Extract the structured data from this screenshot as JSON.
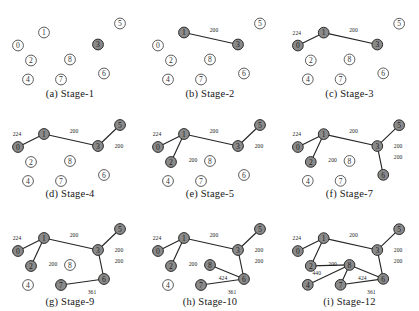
{
  "figure": {
    "title": "",
    "columns": 3,
    "rows": 3,
    "node_ids": [
      "0",
      "1",
      "2",
      "3",
      "4",
      "5",
      "6",
      "7",
      "8"
    ],
    "node_positions": {
      "0": [
        18,
        44
      ],
      "1": [
        44,
        31
      ],
      "2": [
        31,
        59
      ],
      "3": [
        98,
        43
      ],
      "4": [
        28,
        78
      ],
      "5": [
        120,
        22
      ],
      "6": [
        104,
        72
      ],
      "7": [
        61,
        78
      ],
      "8": [
        70,
        58
      ]
    },
    "colors": {
      "node_fill_selected": "#8a8a8a",
      "node_fill_unselected": "#ffffff",
      "node_stroke": "#3a3a3a",
      "edge_stroke": "#262626",
      "text": "#1a1a1a",
      "background": "#ffffff"
    }
  },
  "panels": [
    {
      "id": "panel-a",
      "caption": "(a) Stage-1",
      "selected_nodes": [
        "3"
      ],
      "edges": []
    },
    {
      "id": "panel-b",
      "caption": "(b) Stage-2",
      "selected_nodes": [
        "1",
        "3"
      ],
      "edges": [
        {
          "from": "1",
          "to": "3",
          "weight": "200",
          "label_x": 74,
          "label_y": 28
        }
      ]
    },
    {
      "id": "panel-c",
      "caption": "(c) Stage-3",
      "selected_nodes": [
        "0",
        "1",
        "3"
      ],
      "edges": [
        {
          "from": "1",
          "to": "3",
          "weight": "200",
          "label_x": 74,
          "label_y": 28
        },
        {
          "from": "0",
          "to": "1",
          "weight": "224",
          "label_x": 17,
          "label_y": 31
        }
      ]
    },
    {
      "id": "panel-d",
      "caption": "(d) Stage-4",
      "selected_nodes": [
        "0",
        "1",
        "3",
        "5"
      ],
      "edges": [
        {
          "from": "1",
          "to": "3",
          "weight": "200",
          "label_x": 74,
          "label_y": 28
        },
        {
          "from": "0",
          "to": "1",
          "weight": "224",
          "label_x": 17,
          "label_y": 31
        },
        {
          "from": "3",
          "to": "5",
          "weight": "200",
          "label_x": 119,
          "label_y": 43
        }
      ]
    },
    {
      "id": "panel-e",
      "caption": "(e) Stage-5",
      "selected_nodes": [
        "0",
        "1",
        "2",
        "3",
        "5"
      ],
      "edges": [
        {
          "from": "1",
          "to": "3",
          "weight": "200",
          "label_x": 74,
          "label_y": 28
        },
        {
          "from": "0",
          "to": "1",
          "weight": "224",
          "label_x": 17,
          "label_y": 31
        },
        {
          "from": "3",
          "to": "5",
          "weight": "200",
          "label_x": 119,
          "label_y": 43
        },
        {
          "from": "1",
          "to": "2",
          "weight": "200",
          "label_x": 53,
          "label_y": 57
        }
      ]
    },
    {
      "id": "panel-f",
      "caption": "(f) Stage-7",
      "selected_nodes": [
        "0",
        "1",
        "2",
        "3",
        "5",
        "6"
      ],
      "edges": [
        {
          "from": "1",
          "to": "3",
          "weight": "200",
          "label_x": 74,
          "label_y": 28
        },
        {
          "from": "0",
          "to": "1",
          "weight": "224",
          "label_x": 17,
          "label_y": 31
        },
        {
          "from": "3",
          "to": "5",
          "weight": "200",
          "label_x": 119,
          "label_y": 43
        },
        {
          "from": "1",
          "to": "2",
          "weight": "200",
          "label_x": 53,
          "label_y": 57
        },
        {
          "from": "3",
          "to": "6",
          "weight": "200",
          "label_x": 119,
          "label_y": 54
        }
      ]
    },
    {
      "id": "panel-g",
      "caption": "(g) Stage-9",
      "selected_nodes": [
        "0",
        "1",
        "2",
        "3",
        "5",
        "6",
        "7"
      ],
      "edges": [
        {
          "from": "1",
          "to": "3",
          "weight": "200",
          "label_x": 74,
          "label_y": 28
        },
        {
          "from": "0",
          "to": "1",
          "weight": "224",
          "label_x": 17,
          "label_y": 31
        },
        {
          "from": "3",
          "to": "5",
          "weight": "200",
          "label_x": 119,
          "label_y": 43
        },
        {
          "from": "1",
          "to": "2",
          "weight": "200",
          "label_x": 53,
          "label_y": 57
        },
        {
          "from": "3",
          "to": "6",
          "weight": "200",
          "label_x": 119,
          "label_y": 54
        },
        {
          "from": "7",
          "to": "6",
          "weight": "361",
          "label_x": 92,
          "label_y": 85
        }
      ]
    },
    {
      "id": "panel-h",
      "caption": "(h) Stage-10",
      "selected_nodes": [
        "0",
        "1",
        "2",
        "3",
        "5",
        "6",
        "7",
        "8"
      ],
      "edges": [
        {
          "from": "1",
          "to": "3",
          "weight": "200",
          "label_x": 74,
          "label_y": 28
        },
        {
          "from": "0",
          "to": "1",
          "weight": "224",
          "label_x": 17,
          "label_y": 31
        },
        {
          "from": "3",
          "to": "5",
          "weight": "200",
          "label_x": 119,
          "label_y": 43
        },
        {
          "from": "1",
          "to": "2",
          "weight": "200",
          "label_x": 53,
          "label_y": 57
        },
        {
          "from": "3",
          "to": "6",
          "weight": "200",
          "label_x": 119,
          "label_y": 54
        },
        {
          "from": "7",
          "to": "6",
          "weight": "361",
          "label_x": 92,
          "label_y": 85
        },
        {
          "from": "8",
          "to": "6",
          "weight": "424",
          "label_x": 83,
          "label_y": 71
        }
      ]
    },
    {
      "id": "panel-i",
      "caption": "(i) Stage-12",
      "selected_nodes": [
        "0",
        "1",
        "2",
        "3",
        "4",
        "5",
        "6",
        "7",
        "8"
      ],
      "edges": [
        {
          "from": "1",
          "to": "3",
          "weight": "200",
          "label_x": 74,
          "label_y": 28
        },
        {
          "from": "0",
          "to": "1",
          "weight": "224",
          "label_x": 17,
          "label_y": 31
        },
        {
          "from": "3",
          "to": "5",
          "weight": "200",
          "label_x": 119,
          "label_y": 43
        },
        {
          "from": "1",
          "to": "2",
          "weight": "200",
          "label_x": 53,
          "label_y": 57
        },
        {
          "from": "3",
          "to": "6",
          "weight": "200",
          "label_x": 119,
          "label_y": 54
        },
        {
          "from": "7",
          "to": "6",
          "weight": "361",
          "label_x": 92,
          "label_y": 85
        },
        {
          "from": "8",
          "to": "6",
          "weight": "424",
          "label_x": 83,
          "label_y": 71
        },
        {
          "from": "8",
          "to": "4",
          "weight": "",
          "label_x": 0,
          "label_y": 0
        },
        {
          "from": "8",
          "to": "7",
          "weight": "",
          "label_x": 0,
          "label_y": 0
        },
        {
          "from": "2",
          "to": "8",
          "weight": "440",
          "label_x": 37,
          "label_y": 66
        }
      ]
    }
  ]
}
